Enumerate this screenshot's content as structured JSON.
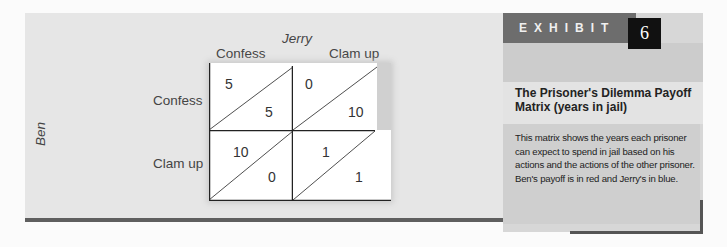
{
  "matrix": {
    "column_player": "Jerry",
    "row_player": "Ben",
    "column_strategies": [
      "Confess",
      "Clam up"
    ],
    "row_strategies": [
      "Confess",
      "Clam up"
    ],
    "cells": [
      [
        {
          "ben": "5",
          "jerry": "5"
        },
        {
          "ben": "0",
          "jerry": "10"
        }
      ],
      [
        {
          "ben": "10",
          "jerry": "0"
        },
        {
          "ben": "1",
          "jerry": "1"
        }
      ]
    ]
  },
  "exhibit": {
    "label": "EXHIBIT",
    "number": "6",
    "title": "The Prisoner's Dilemma Payoff Matrix (years in jail)",
    "description": "This matrix shows the years each prisoner can expect to spend in jail based on his actions and the actions of the other prisoner. Ben's payoff is in red and Jerry's in blue."
  },
  "colors": {
    "panel_bg": "#e6e6e6",
    "exhibit_header": "#6d6d6d",
    "exhibit_number_bg": "#111111",
    "rule": "#5f5f5f"
  }
}
